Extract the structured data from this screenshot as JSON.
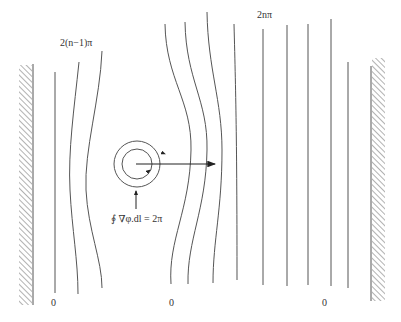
{
  "diagram": {
    "labels": {
      "phase_left": "2(n−1)π",
      "phase_right": "2nπ",
      "circulation": "∮ ∇φ.dl = 2π",
      "zero_left": "0",
      "zero_center": "0",
      "zero_right": "0"
    },
    "elements": [
      "left-wall",
      "right-wall",
      "phase-contour-lines",
      "vortex-circles",
      "flow-arrow",
      "circulation-pointer-arrow"
    ]
  }
}
